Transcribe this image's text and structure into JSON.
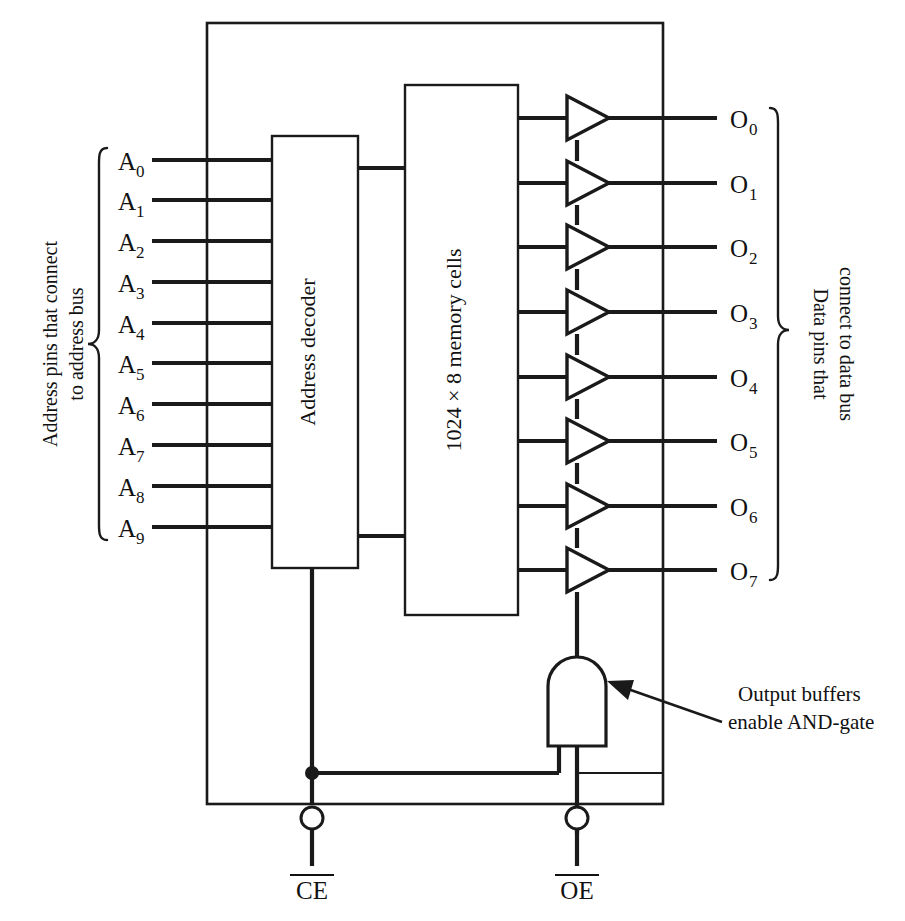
{
  "figure": {
    "line_color": "#1a1a1a",
    "background": "#ffffff"
  },
  "blocks": {
    "address_decoder": {
      "label": "Address decoder"
    },
    "memory_array": {
      "label": "1024 × 8 memory cells"
    }
  },
  "address_pins": {
    "group_label_line1": "Address pins that connect",
    "group_label_line2": "to address bus",
    "pins": [
      {
        "base": "A",
        "sub": "0"
      },
      {
        "base": "A",
        "sub": "1"
      },
      {
        "base": "A",
        "sub": "2"
      },
      {
        "base": "A",
        "sub": "3"
      },
      {
        "base": "A",
        "sub": "4"
      },
      {
        "base": "A",
        "sub": "5"
      },
      {
        "base": "A",
        "sub": "6"
      },
      {
        "base": "A",
        "sub": "7"
      },
      {
        "base": "A",
        "sub": "8"
      },
      {
        "base": "A",
        "sub": "9"
      }
    ]
  },
  "data_pins": {
    "group_label_line1": "Data pins that",
    "group_label_line2": "connect to data bus",
    "pins": [
      {
        "base": "O",
        "sub": "0"
      },
      {
        "base": "O",
        "sub": "1"
      },
      {
        "base": "O",
        "sub": "2"
      },
      {
        "base": "O",
        "sub": "3"
      },
      {
        "base": "O",
        "sub": "4"
      },
      {
        "base": "O",
        "sub": "5"
      },
      {
        "base": "O",
        "sub": "6"
      },
      {
        "base": "O",
        "sub": "7"
      }
    ]
  },
  "control_pins": [
    {
      "label": "CE",
      "active_low": true
    },
    {
      "label": "OE",
      "active_low": true
    }
  ],
  "annotation": {
    "line1": "Output buffers",
    "line2": "enable AND-gate"
  },
  "components": {
    "output_buffer_count": 8,
    "and_gate_name": "AND-gate",
    "and_gate_inputs": 2
  }
}
